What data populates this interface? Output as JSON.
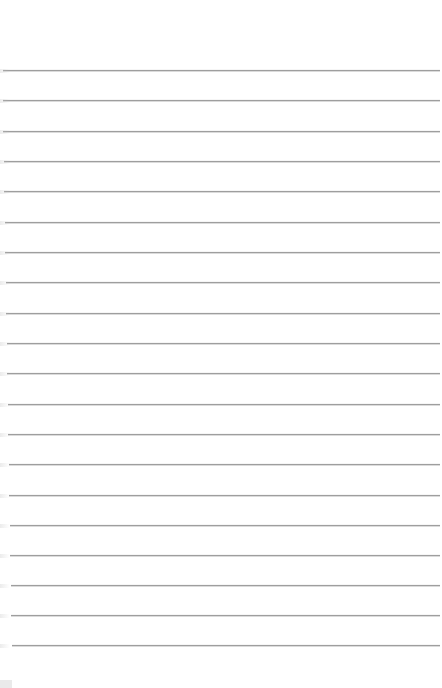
{
  "page": {
    "type": "lined-paper",
    "background_color": "#ffffff",
    "line_color": "#9e9e9e",
    "line_count": 20,
    "lines": [
      {
        "y": 70,
        "x_start": 3,
        "x_end": 440
      },
      {
        "y": 100,
        "x_start": 3,
        "x_end": 440
      },
      {
        "y": 131,
        "x_start": 3,
        "x_end": 440
      },
      {
        "y": 161,
        "x_start": 4,
        "x_end": 440
      },
      {
        "y": 191,
        "x_start": 4,
        "x_end": 440
      },
      {
        "y": 222,
        "x_start": 5,
        "x_end": 440
      },
      {
        "y": 252,
        "x_start": 5,
        "x_end": 440
      },
      {
        "y": 282,
        "x_start": 6,
        "x_end": 440
      },
      {
        "y": 313,
        "x_start": 6,
        "x_end": 440
      },
      {
        "y": 343,
        "x_start": 7,
        "x_end": 440
      },
      {
        "y": 373,
        "x_start": 7,
        "x_end": 440
      },
      {
        "y": 404,
        "x_start": 8,
        "x_end": 440
      },
      {
        "y": 434,
        "x_start": 8,
        "x_end": 440
      },
      {
        "y": 464,
        "x_start": 9,
        "x_end": 440
      },
      {
        "y": 495,
        "x_start": 9,
        "x_end": 440
      },
      {
        "y": 525,
        "x_start": 10,
        "x_end": 440
      },
      {
        "y": 555,
        "x_start": 10,
        "x_end": 440
      },
      {
        "y": 585,
        "x_start": 11,
        "x_end": 440
      },
      {
        "y": 615,
        "x_start": 11,
        "x_end": 440
      },
      {
        "y": 645,
        "x_start": 12,
        "x_end": 440
      }
    ]
  }
}
